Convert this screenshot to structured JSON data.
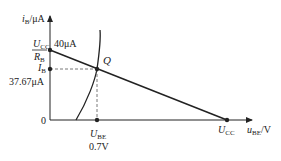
{
  "diagram": {
    "colors": {
      "line": "#222222",
      "dash": "#555555",
      "background": "#ffffff"
    },
    "y_axis": {
      "var": "i",
      "sub": "B",
      "unit": "/μA"
    },
    "x_axis": {
      "var": "u",
      "sub": "BE",
      "unit": "/V"
    },
    "origin_label": "0",
    "intercept_y": {
      "num_var": "U",
      "num_sub": "CC",
      "den_var": "R",
      "den_sub": "B",
      "value": "40μA"
    },
    "q_point": {
      "label": "Q",
      "ib_var": "I",
      "ib_sub": "B",
      "ib_value": "37.67μA",
      "ube_var": "U",
      "ube_sub": "BE",
      "ube_value": "0.7V"
    },
    "intercept_x": {
      "var": "U",
      "sub": "CC"
    }
  }
}
